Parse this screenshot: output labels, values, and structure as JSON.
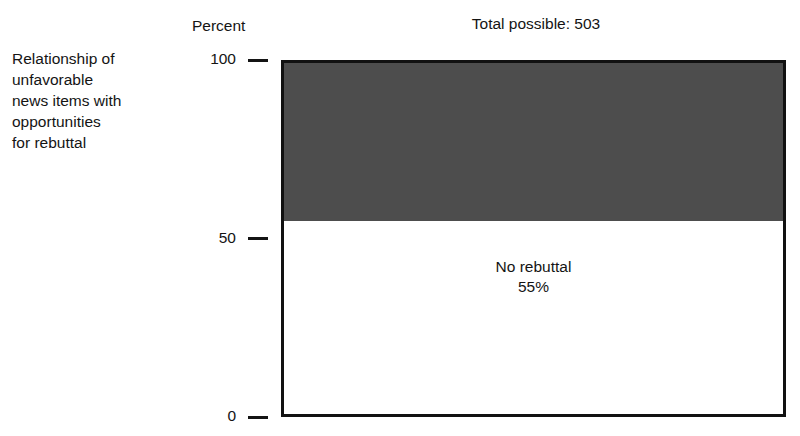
{
  "caption": {
    "text": "Relationship of\nunfavorable\nnews items with\nopportunities\nfor rebuttal"
  },
  "axis_unit_label": "Percent",
  "title": "Total possible: 503",
  "chart_data": {
    "type": "bar",
    "title": "Total possible: 503",
    "subtitle": "",
    "xlabel": "",
    "ylabel": "Percent",
    "ylim": [
      0,
      100
    ],
    "yticks": [
      0,
      50,
      100
    ],
    "ytick_labels": [
      "0",
      "50",
      "100"
    ],
    "grid": false,
    "legend": false,
    "orientation": "vertical-stacked",
    "total_possible": 503,
    "categories": [
      "Unfavorable news items"
    ],
    "series": [
      {
        "name": "Rebuttal opportunity",
        "label": "",
        "value_label": "",
        "values": [
          45
        ],
        "color": "#4d4d4d",
        "show_label": false
      },
      {
        "name": "No rebuttal",
        "label": "No rebuttal",
        "value_label": "55%",
        "values": [
          55
        ],
        "color": "#ffffff",
        "show_label": true
      }
    ],
    "annotations": [
      {
        "text": "No rebuttal",
        "value": "55%"
      }
    ]
  },
  "colors": {
    "filled_segment": "#4d4d4d",
    "open_segment": "#ffffff",
    "axis": "#111111",
    "text": "#141414"
  }
}
